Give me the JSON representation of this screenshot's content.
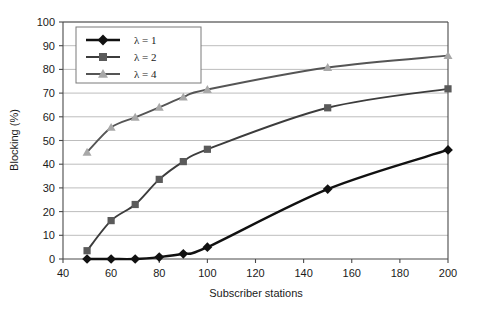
{
  "chart_data": {
    "type": "line",
    "title": "",
    "xlabel": "Subscriber stations",
    "ylabel": "Blocking (%)",
    "xlim": [
      40,
      200
    ],
    "ylim": [
      0,
      100
    ],
    "xticks": [
      40,
      60,
      80,
      100,
      120,
      140,
      160,
      180,
      200
    ],
    "yticks": [
      0,
      10,
      20,
      30,
      40,
      50,
      60,
      70,
      80,
      90,
      100
    ],
    "grid": "horizontal",
    "legend_position": "top-left",
    "x": [
      50,
      60,
      70,
      80,
      90,
      100,
      150,
      200
    ],
    "series": [
      {
        "name": "λ = 1",
        "marker": "diamond",
        "line_color": "#111111",
        "marker_color": "#111111",
        "values": [
          0,
          0,
          0,
          0.8,
          2.2,
          5.0,
          29.5,
          46.0
        ]
      },
      {
        "name": "λ = 2",
        "marker": "square",
        "line_color": "#3c3c3c",
        "marker_color": "#5a5a5a",
        "values": [
          3.5,
          16.2,
          23.0,
          33.6,
          41.1,
          46.3,
          63.8,
          71.8
        ]
      },
      {
        "name": "λ = 4",
        "marker": "triangle",
        "line_color": "#555555",
        "marker_color": "#a8a8a8",
        "values": [
          45.0,
          55.5,
          59.8,
          64.0,
          68.3,
          71.5,
          80.8,
          85.8
        ]
      }
    ]
  },
  "axes": {
    "x_tick_labels": [
      "40",
      "60",
      "80",
      "100",
      "120",
      "140",
      "160",
      "180",
      "200"
    ],
    "y_tick_labels": [
      "0",
      "10",
      "20",
      "30",
      "40",
      "50",
      "60",
      "70",
      "80",
      "90",
      "100"
    ],
    "x_axis_title": "Subscriber stations",
    "y_axis_title": "Blocking (%)"
  },
  "legend": {
    "entries": [
      {
        "label": "λ = 1"
      },
      {
        "label": "λ = 2"
      },
      {
        "label": "λ = 4"
      }
    ]
  },
  "colors": {
    "lambda1": "#111111",
    "lambda2": "#5a5a5a",
    "lambda4": "#a8a8a8",
    "grid": "#b5b5b5",
    "axis": "#4a4a4a",
    "background": "#ffffff"
  }
}
